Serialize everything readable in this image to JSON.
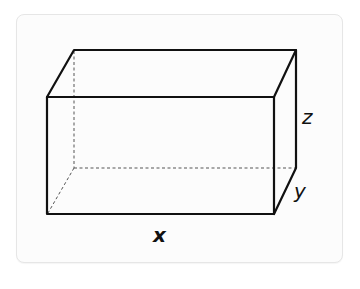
{
  "diagram": {
    "type": "rectangular-prism",
    "labels": {
      "length": "x",
      "depth": "y",
      "height": "z"
    },
    "colors": {
      "edge": "#111111",
      "hidden_edge": "#555555",
      "panel_background": "#fcfcfc",
      "panel_border": "#e6e6e6"
    }
  }
}
